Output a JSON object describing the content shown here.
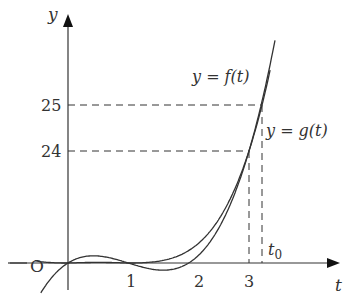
{
  "figure": {
    "axes": {
      "x_label": "t",
      "y_label": "y",
      "origin_label": "O",
      "x_ticks": [
        "1",
        "2",
        "3"
      ],
      "x_special": "t",
      "x_special_sub": "0",
      "y_ticks": [
        "24",
        "25"
      ]
    },
    "curves": [
      {
        "label": "y = f(t)",
        "name": "f"
      },
      {
        "label": "y = g(t)",
        "name": "g"
      }
    ],
    "colors": {
      "line": "#333333",
      "background": "#ffffff"
    }
  },
  "chart_data": {
    "type": "line",
    "title": "",
    "xlabel": "t",
    "ylabel": "y",
    "series": [
      {
        "name": "y = f(t)",
        "points": [
          [
            0,
            0
          ],
          [
            1,
            0
          ],
          [
            3,
            24
          ],
          [
            3.2,
            25
          ]
        ]
      },
      {
        "name": "y = g(t)",
        "points": [
          [
            0,
            0
          ],
          [
            1,
            0
          ],
          [
            2,
            0
          ],
          [
            3,
            24
          ]
        ]
      }
    ],
    "annotations": [
      "O",
      "t0",
      "24",
      "25"
    ],
    "marked_x": [
      1,
      2,
      3,
      "t0"
    ],
    "marked_y": [
      24,
      25
    ],
    "grid": false
  }
}
